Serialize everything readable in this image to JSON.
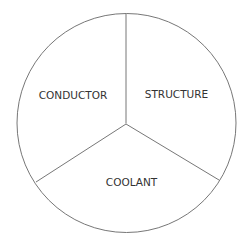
{
  "diagram": {
    "type": "pie-partition",
    "colors": {
      "stroke": "#777777",
      "text": "#333333",
      "background": "#ffffff"
    },
    "segments": [
      {
        "label": "CONDUCTOR",
        "position": "left"
      },
      {
        "label": "STRUCTURE",
        "position": "right"
      },
      {
        "label": "COOLANT",
        "position": "bottom"
      }
    ]
  }
}
